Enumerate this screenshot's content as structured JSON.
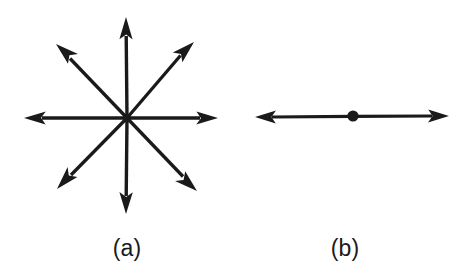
{
  "figure": {
    "background_color": "#ffffff",
    "ink_color": "#1a1a1a",
    "width": 473,
    "height": 273,
    "panels": [
      {
        "id": "panel-a",
        "caption": "(a)",
        "caption_position": {
          "x": 127,
          "y": 248
        },
        "description": "eight arrows radiating outward from a common center point",
        "center": {
          "x": 127,
          "y": 118
        },
        "arrow_count": 8,
        "arrows": [
          {
            "name": "arrow-up",
            "angle_deg": 90,
            "tip": {
              "x": 126,
              "y": 17
            }
          },
          {
            "name": "arrow-up-right",
            "angle_deg": 45,
            "tip": {
              "x": 194,
              "y": 42
            }
          },
          {
            "name": "arrow-right",
            "angle_deg": 0,
            "tip": {
              "x": 218,
              "y": 118
            }
          },
          {
            "name": "arrow-down-right",
            "angle_deg": -45,
            "tip": {
              "x": 197,
              "y": 191
            }
          },
          {
            "name": "arrow-down",
            "angle_deg": -90,
            "tip": {
              "x": 126,
              "y": 214
            }
          },
          {
            "name": "arrow-down-left",
            "angle_deg": -135,
            "tip": {
              "x": 57,
              "y": 189
            }
          },
          {
            "name": "arrow-left",
            "angle_deg": 180,
            "tip": {
              "x": 24,
              "y": 118
            }
          },
          {
            "name": "arrow-up-left",
            "angle_deg": 135,
            "tip": {
              "x": 56,
              "y": 44
            }
          }
        ]
      },
      {
        "id": "panel-b",
        "caption": "(b)",
        "caption_position": {
          "x": 345,
          "y": 248
        },
        "description": "single horizontal double-headed arrow with a filled dot at its midpoint",
        "center": {
          "x": 353,
          "y": 116
        },
        "dot_radius": 5.5,
        "arrow_count": 2,
        "arrows": [
          {
            "name": "arrow-left",
            "angle_deg": 180,
            "tip": {
              "x": 255,
              "y": 117
            }
          },
          {
            "name": "arrow-right",
            "angle_deg": 0,
            "tip": {
              "x": 449,
              "y": 116
            }
          }
        ]
      }
    ]
  }
}
